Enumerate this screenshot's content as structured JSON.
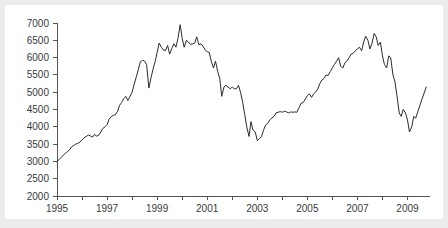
{
  "figure": {
    "background_color": "#ececec",
    "card_color": "#ffffff",
    "line_color": "#2b2b2b",
    "axis_color": "#555555"
  },
  "chart_data": {
    "type": "line",
    "title": "",
    "subtitle": "",
    "xlabel": "",
    "ylabel": "",
    "xlim": [
      1995.0,
      2009.9
    ],
    "ylim": [
      2000,
      7000
    ],
    "grid": false,
    "legend": "none",
    "y_ticks": [
      2000,
      2500,
      3000,
      3500,
      4000,
      4500,
      5000,
      5500,
      6000,
      6500,
      7000
    ],
    "y_tick_labels": [
      "2000",
      "2500",
      "3000",
      "3500",
      "4000",
      "4500",
      "5000",
      "5500",
      "6000",
      "6500",
      "7000"
    ],
    "x_ticks": [
      1995,
      1996,
      1997,
      1998,
      1999,
      2000,
      2001,
      2002,
      2003,
      2004,
      2005,
      2006,
      2007,
      2008,
      2009
    ],
    "x_tick_labels": [
      "1995",
      "",
      "1997",
      "",
      "1999",
      "",
      "2001",
      "",
      "2003",
      "",
      "2005",
      "",
      "2007",
      "",
      "2009"
    ],
    "series": [
      {
        "name": "Index level",
        "x": [
          1995.0,
          1995.08,
          1995.17,
          1995.25,
          1995.33,
          1995.42,
          1995.5,
          1995.58,
          1995.67,
          1995.75,
          1995.83,
          1995.92,
          1996.0,
          1996.08,
          1996.17,
          1996.25,
          1996.33,
          1996.42,
          1996.5,
          1996.58,
          1996.67,
          1996.75,
          1996.83,
          1996.92,
          1997.0,
          1997.08,
          1997.17,
          1997.25,
          1997.33,
          1997.42,
          1997.5,
          1997.58,
          1997.67,
          1997.75,
          1997.83,
          1997.92,
          1998.0,
          1998.08,
          1998.17,
          1998.25,
          1998.33,
          1998.42,
          1998.5,
          1998.58,
          1998.67,
          1998.75,
          1998.83,
          1998.92,
          1999.0,
          1999.08,
          1999.17,
          1999.25,
          1999.33,
          1999.42,
          1999.5,
          1999.58,
          1999.67,
          1999.75,
          1999.83,
          1999.92,
          2000.0,
          2000.08,
          2000.17,
          2000.25,
          2000.33,
          2000.42,
          2000.5,
          2000.58,
          2000.67,
          2000.75,
          2000.83,
          2000.92,
          2001.0,
          2001.08,
          2001.17,
          2001.25,
          2001.33,
          2001.42,
          2001.5,
          2001.58,
          2001.67,
          2001.75,
          2001.83,
          2001.92,
          2002.0,
          2002.08,
          2002.17,
          2002.25,
          2002.33,
          2002.42,
          2002.5,
          2002.58,
          2002.67,
          2002.75,
          2002.83,
          2002.92,
          2003.0,
          2003.08,
          2003.17,
          2003.25,
          2003.33,
          2003.42,
          2003.5,
          2003.58,
          2003.67,
          2003.75,
          2003.83,
          2003.92,
          2004.0,
          2004.08,
          2004.17,
          2004.25,
          2004.33,
          2004.42,
          2004.5,
          2004.58,
          2004.67,
          2004.75,
          2004.83,
          2004.92,
          2005.0,
          2005.08,
          2005.17,
          2005.25,
          2005.33,
          2005.42,
          2005.5,
          2005.58,
          2005.67,
          2005.75,
          2005.83,
          2005.92,
          2006.0,
          2006.08,
          2006.17,
          2006.25,
          2006.33,
          2006.42,
          2006.5,
          2006.58,
          2006.67,
          2006.75,
          2006.83,
          2006.92,
          2007.0,
          2007.08,
          2007.17,
          2007.25,
          2007.33,
          2007.42,
          2007.5,
          2007.58,
          2007.67,
          2007.75,
          2007.83,
          2007.92,
          2008.0,
          2008.08,
          2008.17,
          2008.25,
          2008.33,
          2008.42,
          2008.5,
          2008.58,
          2008.67,
          2008.75,
          2008.83,
          2008.92,
          2009.0,
          2009.08,
          2009.17,
          2009.25,
          2009.33,
          2009.42,
          2009.58,
          2009.75
        ],
        "values": [
          3000,
          3050,
          3120,
          3180,
          3230,
          3290,
          3330,
          3420,
          3460,
          3500,
          3520,
          3560,
          3620,
          3680,
          3720,
          3760,
          3740,
          3700,
          3780,
          3730,
          3760,
          3850,
          3950,
          4000,
          4060,
          4220,
          4300,
          4330,
          4350,
          4450,
          4620,
          4700,
          4820,
          4880,
          4760,
          4880,
          5000,
          5220,
          5450,
          5660,
          5880,
          5920,
          5900,
          5800,
          5120,
          5400,
          5650,
          5880,
          6150,
          6420,
          6300,
          6220,
          6200,
          6350,
          6100,
          6250,
          6400,
          6300,
          6550,
          6950,
          6560,
          6300,
          6500,
          6450,
          6380,
          6400,
          6420,
          6600,
          6370,
          6400,
          6330,
          6220,
          6170,
          6150,
          5880,
          5700,
          5900,
          5600,
          5400,
          4880,
          5150,
          5200,
          5150,
          5100,
          5150,
          5100,
          5100,
          5200,
          5000,
          4700,
          4350,
          4000,
          3720,
          4150,
          3900,
          3850,
          3600,
          3650,
          3720,
          3900,
          4050,
          4100,
          4200,
          4250,
          4300,
          4400,
          4420,
          4440,
          4420,
          4450,
          4430,
          4400,
          4430,
          4420,
          4430,
          4420,
          4550,
          4680,
          4700,
          4800,
          4900,
          4950,
          4850,
          4950,
          5000,
          5100,
          5250,
          5350,
          5400,
          5500,
          5480,
          5600,
          5700,
          5800,
          5900,
          6000,
          5750,
          5700,
          5850,
          5900,
          6000,
          6100,
          6120,
          6200,
          6250,
          6300,
          6200,
          6450,
          6620,
          6500,
          6250,
          6400,
          6700,
          6600,
          6350,
          6450,
          6050,
          5800,
          5700,
          6050,
          6000,
          5500,
          5300,
          4900,
          4400,
          4300,
          4500,
          4400,
          4200,
          3850,
          4000,
          4300,
          4250,
          4450,
          4800,
          5150
        ]
      }
    ]
  },
  "axis": {
    "y_axis_name": "index-value-axis",
    "x_axis_name": "year-axis"
  }
}
